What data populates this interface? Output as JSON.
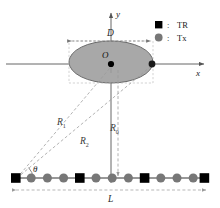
{
  "figure": {
    "background_color": "#ffffff"
  },
  "axes": {
    "x_label": "x",
    "y_label": "y",
    "origin_label": "O",
    "axis_color": "#555555",
    "origin_dot_color": "#000000"
  },
  "target": {
    "shape": "ellipse",
    "fill_color": "#a8a8a8",
    "stroke_color": "#6b6b6b",
    "edge_marker_color": "#1a1a1a",
    "width_label": "D"
  },
  "ranges": {
    "r1_label": "R",
    "r1_sub": "1",
    "r2_label": "R",
    "r2_sub": "2",
    "r0_label": "R",
    "r0_sub": "0",
    "line_color": "#9a9a9a"
  },
  "angle": {
    "label": "θ",
    "arc_color": "#555555"
  },
  "array": {
    "length_label": "L",
    "baseline_color": "#333333",
    "tr_color": "#000000",
    "tx_color": "#777777",
    "elements": [
      {
        "type": "TR"
      },
      {
        "type": "Tx"
      },
      {
        "type": "Tx"
      },
      {
        "type": "Tx"
      },
      {
        "type": "TR"
      },
      {
        "type": "Tx"
      },
      {
        "type": "Tx"
      },
      {
        "type": "Tx"
      },
      {
        "type": "TR"
      },
      {
        "type": "Tx"
      },
      {
        "type": "Tx"
      },
      {
        "type": "Tx"
      },
      {
        "type": "TR"
      }
    ]
  },
  "legend": {
    "separator": ":",
    "items": [
      {
        "marker": "square",
        "label": "TR",
        "color": "#000000"
      },
      {
        "marker": "circle",
        "label": "Tx",
        "color": "#777777"
      }
    ]
  }
}
